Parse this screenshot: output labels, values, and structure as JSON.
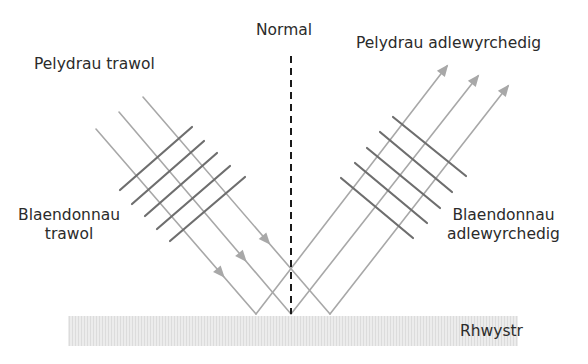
{
  "diagram": {
    "labels": {
      "normal": "Normal",
      "incident_rays": "Pelydrau trawol",
      "reflected_rays": "Pelydrau adlewyrchedig",
      "incident_wavefronts_line1": "Blaendonnau",
      "incident_wavefronts_line2": "trawol",
      "reflected_wavefronts_line1": "Blaendonnau",
      "reflected_wavefronts_line2": "adlewyrchedig",
      "barrier": "Rhwystr"
    },
    "ray_count": 3,
    "incident_wavefront_count": 5,
    "reflected_wavefront_count": 5,
    "colors": {
      "ray": "#a8a8a8",
      "wavefront": "#6e6e6e",
      "normal": "#1a1a1a",
      "barrier": "#e6e6e6",
      "text": "#2b2b2b"
    }
  }
}
